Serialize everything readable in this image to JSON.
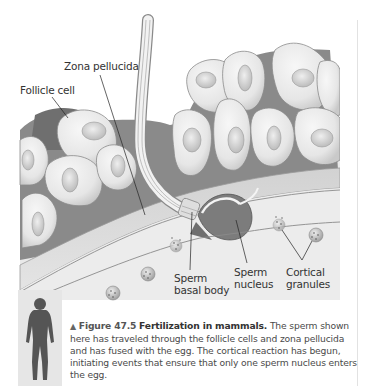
{
  "figure": {
    "labels": {
      "zona_pellucida": "Zona pellucida",
      "follicle_cell": "Follicle cell",
      "sperm_basal_body_line1": "Sperm",
      "sperm_basal_body_line2": "basal body",
      "sperm_nucleus_line1": "Sperm",
      "sperm_nucleus_line2": "nucleus",
      "cortical_granules_line1": "Cortical",
      "cortical_granules_line2": "granules"
    },
    "caption": {
      "marker": "▲",
      "figure_number": "Figure 47.5",
      "title": "Fertilization in mammals.",
      "body": "The sperm shown here has traveled through the follicle cells and zona pellucida and has fused with the egg. The cortical reaction has begun, initiating events that ensure that only one sperm nucleus enters the egg."
    },
    "colors": {
      "cell_fill": "#ececec",
      "cell_stroke": "#8a8a8a",
      "dark_matrix": "#7a7a7a",
      "zona": "#dcdcdc",
      "egg": "#e8e8e8",
      "text": "#333333"
    }
  }
}
